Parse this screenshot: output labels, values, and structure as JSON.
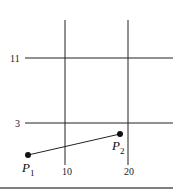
{
  "diagram": {
    "grid": {
      "vertical_lines": [
        {
          "label": "10",
          "x": 65
        },
        {
          "label": "20",
          "x": 128
        }
      ],
      "horizontal_lines": [
        {
          "label": "11",
          "y": 58
        },
        {
          "label": "3",
          "y": 123
        }
      ]
    },
    "points": [
      {
        "name": "P",
        "subscript": "1",
        "x": 28,
        "y": 155
      },
      {
        "name": "P",
        "subscript": "2",
        "x": 120,
        "y": 134
      }
    ],
    "segment": {
      "from": "P1",
      "to": "P2"
    },
    "colors": {
      "line": "#222222",
      "point": "#111111",
      "background": "#ffffff"
    }
  }
}
